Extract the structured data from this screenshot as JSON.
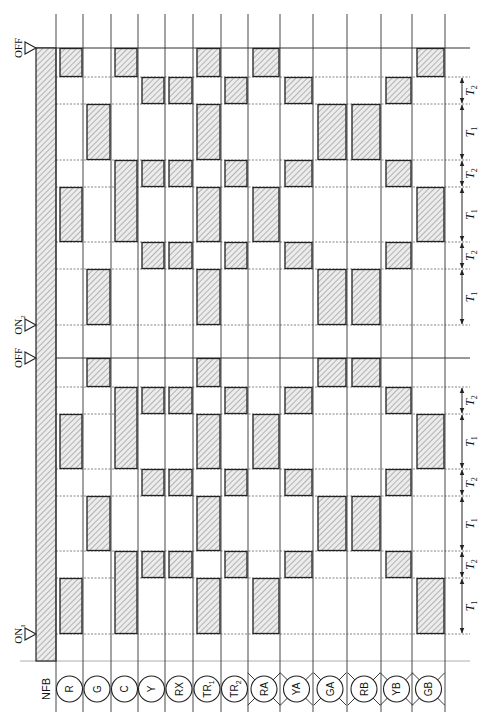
{
  "diagram": {
    "colors": {
      "line": "#222222",
      "grid_dashed": "#555555",
      "hatch": "#777777",
      "hatch_bg": "#e8e8e8"
    },
    "markers": [
      {
        "id": "off_top",
        "label": "OFF",
        "y": 48
      },
      {
        "id": "on2",
        "label": "ON",
        "sub": "2",
        "y": 325
      },
      {
        "id": "off_mid",
        "label": "OFF",
        "y": 358
      },
      {
        "id": "on1",
        "label": "ON",
        "sub": "1",
        "y": 634
      }
    ],
    "time_lines": [
      {
        "y": 48,
        "style": "solid"
      },
      {
        "y": 77,
        "style": "dashed"
      },
      {
        "y": 104,
        "style": "dashed"
      },
      {
        "y": 160,
        "style": "dashed"
      },
      {
        "y": 187,
        "style": "dashed"
      },
      {
        "y": 242,
        "style": "dashed"
      },
      {
        "y": 269,
        "style": "dashed"
      },
      {
        "y": 325,
        "style": "dashed"
      },
      {
        "y": 358,
        "style": "solid"
      },
      {
        "y": 387,
        "style": "dashed"
      },
      {
        "y": 414,
        "style": "dashed"
      },
      {
        "y": 469,
        "style": "dashed"
      },
      {
        "y": 496,
        "style": "dashed"
      },
      {
        "y": 551,
        "style": "dashed"
      },
      {
        "y": 578,
        "style": "dashed"
      },
      {
        "y": 634,
        "style": "dashed"
      }
    ],
    "bottom_line_y": 661,
    "nfb": {
      "label": "NFB",
      "x1": 36,
      "x2": 56,
      "y1": 48,
      "y2": 661
    },
    "columns": [
      {
        "label": "R",
        "sub": "",
        "type": "coil",
        "x1": 56,
        "x2": 83,
        "blocks": [
          [
            48,
            77
          ],
          [
            187,
            242
          ],
          [
            414,
            469
          ],
          [
            578,
            634
          ]
        ]
      },
      {
        "label": "G",
        "sub": "",
        "type": "coil",
        "x1": 83,
        "x2": 111,
        "blocks": [
          [
            104,
            160
          ],
          [
            269,
            325
          ],
          [
            358,
            387
          ],
          [
            496,
            551
          ]
        ]
      },
      {
        "label": "C",
        "sub": "",
        "type": "coil",
        "x1": 111,
        "x2": 138,
        "blocks": [
          [
            48,
            77
          ],
          [
            160,
            242
          ],
          [
            387,
            469
          ],
          [
            551,
            634
          ]
        ]
      },
      {
        "label": "Y",
        "sub": "",
        "type": "coil",
        "x1": 138,
        "x2": 165,
        "blocks": [
          [
            77,
            104
          ],
          [
            160,
            187
          ],
          [
            242,
            269
          ],
          [
            387,
            414
          ],
          [
            469,
            496
          ],
          [
            551,
            578
          ]
        ]
      },
      {
        "label": "RX",
        "sub": "",
        "type": "coil",
        "x1": 165,
        "x2": 193,
        "blocks": [
          [
            77,
            104
          ],
          [
            160,
            187
          ],
          [
            242,
            269
          ],
          [
            387,
            414
          ],
          [
            469,
            496
          ],
          [
            551,
            578
          ]
        ]
      },
      {
        "label": "TR",
        "sub": "1",
        "type": "coil",
        "x1": 193,
        "x2": 221,
        "blocks": [
          [
            48,
            77
          ],
          [
            104,
            160
          ],
          [
            187,
            242
          ],
          [
            269,
            325
          ],
          [
            358,
            387
          ],
          [
            414,
            469
          ],
          [
            496,
            551
          ],
          [
            578,
            634
          ]
        ]
      },
      {
        "label": "TR",
        "sub": "2",
        "type": "coil",
        "x1": 221,
        "x2": 248,
        "blocks": [
          [
            77,
            104
          ],
          [
            160,
            187
          ],
          [
            242,
            269
          ],
          [
            387,
            414
          ],
          [
            469,
            496
          ],
          [
            551,
            578
          ]
        ]
      },
      {
        "label": "RA",
        "sub": "",
        "type": "lamp",
        "x1": 248,
        "x2": 280,
        "blocks": [
          [
            48,
            77
          ],
          [
            187,
            242
          ],
          [
            414,
            469
          ],
          [
            578,
            634
          ]
        ]
      },
      {
        "label": "YA",
        "sub": "",
        "type": "lamp",
        "x1": 280,
        "x2": 313,
        "blocks": [
          [
            77,
            104
          ],
          [
            160,
            187
          ],
          [
            242,
            269
          ],
          [
            387,
            414
          ],
          [
            469,
            496
          ],
          [
            551,
            578
          ]
        ]
      },
      {
        "label": "GA",
        "sub": "",
        "type": "lamp",
        "x1": 313,
        "x2": 347,
        "blocks": [
          [
            104,
            160
          ],
          [
            269,
            325
          ],
          [
            358,
            387
          ],
          [
            496,
            551
          ]
        ]
      },
      {
        "label": "RB",
        "sub": "",
        "type": "lamp",
        "x1": 347,
        "x2": 381,
        "blocks": [
          [
            104,
            160
          ],
          [
            269,
            325
          ],
          [
            358,
            387
          ],
          [
            496,
            551
          ]
        ]
      },
      {
        "label": "YB",
        "sub": "",
        "type": "lamp",
        "x1": 381,
        "x2": 412,
        "blocks": [
          [
            77,
            104
          ],
          [
            160,
            187
          ],
          [
            242,
            269
          ],
          [
            387,
            414
          ],
          [
            469,
            496
          ],
          [
            551,
            578
          ]
        ]
      },
      {
        "label": "GB",
        "sub": "",
        "type": "lamp",
        "x1": 412,
        "x2": 445,
        "blocks": [
          [
            48,
            77
          ],
          [
            187,
            242
          ],
          [
            414,
            469
          ],
          [
            578,
            634
          ]
        ]
      }
    ],
    "intervals": [
      {
        "label": "T",
        "sub": "2",
        "y1": 77,
        "y2": 104
      },
      {
        "label": "T",
        "sub": "1",
        "y1": 104,
        "y2": 160
      },
      {
        "label": "T",
        "sub": "2",
        "y1": 160,
        "y2": 187
      },
      {
        "label": "T",
        "sub": "1",
        "y1": 187,
        "y2": 242
      },
      {
        "label": "T",
        "sub": "2",
        "y1": 242,
        "y2": 269
      },
      {
        "label": "T",
        "sub": "1",
        "y1": 269,
        "y2": 325
      },
      {
        "label": "T",
        "sub": "2",
        "y1": 387,
        "y2": 414
      },
      {
        "label": "T",
        "sub": "1",
        "y1": 414,
        "y2": 469
      },
      {
        "label": "T",
        "sub": "2",
        "y1": 469,
        "y2": 496
      },
      {
        "label": "T",
        "sub": "1",
        "y1": 496,
        "y2": 551
      },
      {
        "label": "T",
        "sub": "2",
        "y1": 551,
        "y2": 578
      },
      {
        "label": "T",
        "sub": "1",
        "y1": 578,
        "y2": 634
      }
    ]
  }
}
